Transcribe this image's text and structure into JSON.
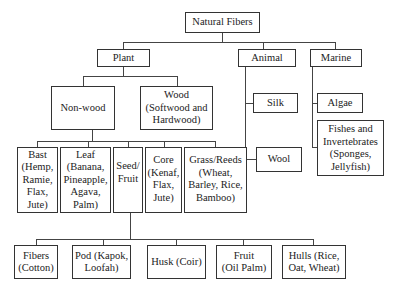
{
  "diagram": {
    "root": "Natural Fibers",
    "level1": {
      "plant": "Plant",
      "animal": "Animal",
      "marine": "Marine"
    },
    "plant_children": {
      "non_wood": "Non-wood",
      "wood": "Wood\n(Softwood and\nHardwood)"
    },
    "non_wood_children": {
      "bast": "Bast\n(Hemp,\nRamie,\nFlax,\nJute)",
      "leaf": "Leaf\n(Banana,\nPineapple,\nAgava,\nPalm)",
      "seed_fruit": "Seed/\nFruit",
      "core": "Core\n(Kenaf,\nFlax,\nJute)",
      "grass_reeds": "Grass/Reeds\n(Wheat,\nBarley, Rice,\nBamboo)"
    },
    "seed_fruit_children": {
      "fibers": "Fibers\n(Cotton)",
      "pod": "Pod (Kapok,\nLoofah)",
      "husk": "Husk (Coir)",
      "fruit": "Fruit\n(Oil Palm)",
      "hulls": "Hulls (Rice,\nOat, Wheat)"
    },
    "animal_children": {
      "silk": "Silk",
      "wool": "Wool"
    },
    "marine_children": {
      "algae": "Algae",
      "fishes": "Fishes and\nInvertebrates\n(Sponges,\nJellyfish)"
    }
  }
}
